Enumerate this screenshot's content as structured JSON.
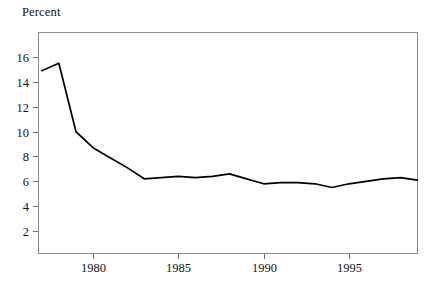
{
  "figure": {
    "axis_caption": "Percent",
    "background_color": "#ffffff",
    "frame_color": "#8d8d8d",
    "line_color": "#000000"
  },
  "chart_data": {
    "type": "line",
    "title": "",
    "subtitle": "",
    "xlabel": "",
    "ylabel": "Percent",
    "grid": false,
    "legend": null,
    "xlim": [
      1977,
      1999
    ],
    "ylim": [
      0,
      17.5
    ],
    "x_tick_labels": [
      "1980",
      "1985",
      "1990",
      "1995"
    ],
    "x_ticks": [
      1980,
      1985,
      1990,
      1995
    ],
    "y_tick_labels": [
      "2",
      "4",
      "6",
      "8",
      "10",
      "12",
      "14",
      "16"
    ],
    "y_ticks": [
      2,
      4,
      6,
      8,
      10,
      12,
      14,
      16
    ],
    "x": [
      1977,
      1978,
      1979,
      1980,
      1981,
      1982,
      1983,
      1984,
      1985,
      1986,
      1987,
      1988,
      1989,
      1990,
      1991,
      1992,
      1993,
      1994,
      1995,
      1996,
      1997,
      1998,
      1999
    ],
    "values": [
      14.9,
      15.5,
      10.0,
      8.7,
      7.9,
      7.1,
      6.2,
      6.3,
      6.4,
      6.3,
      6.4,
      6.6,
      6.2,
      5.8,
      5.9,
      5.9,
      5.8,
      5.5,
      5.8,
      6.0,
      6.2,
      6.3,
      6.1
    ],
    "series": [
      {
        "name": "Percent",
        "values": [
          14.9,
          15.5,
          10.0,
          8.7,
          7.9,
          7.1,
          6.2,
          6.3,
          6.4,
          6.3,
          6.4,
          6.6,
          6.2,
          5.8,
          5.9,
          5.9,
          5.8,
          5.5,
          5.8,
          6.0,
          6.2,
          6.3,
          6.1
        ]
      }
    ]
  },
  "geometry": {
    "plot_left": 38,
    "plot_right": 418,
    "plot_top": 32,
    "plot_bottom": 254,
    "x_pixel_1980": 93,
    "x_pixel_per_year": 17.07,
    "y_pixel_16": 57,
    "y_pixel_per_unit": 12.43,
    "tick_length": 5
  }
}
